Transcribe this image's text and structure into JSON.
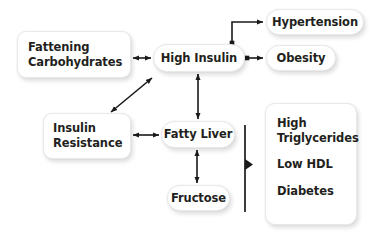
{
  "diagram": {
    "background_color": "#ffffff",
    "text_color": "#231f20",
    "connector_color": "#1a1a1a",
    "nodes": {
      "fattening_carbohydrates": {
        "line1": "Fattening",
        "line2": "Carbohydrates"
      },
      "high_insulin": {
        "label": "High Insulin"
      },
      "hypertension": {
        "label": "Hypertension"
      },
      "obesity": {
        "label": "Obesity"
      },
      "insulin_resistance": {
        "line1": "Insulin",
        "line2": "Resistance"
      },
      "fatty_liver": {
        "label": "Fatty Liver"
      },
      "fructose": {
        "label": "Fructose"
      },
      "outcomes": {
        "item1_line1": "High",
        "item1_line2": "Triglycerides",
        "item2": "Low HDL",
        "item3": "Diabetes"
      }
    },
    "connectors": [
      {
        "name": "fattening-carbohydrates-to-high-insulin",
        "style": "double-arrow",
        "orientation": "horizontal"
      },
      {
        "name": "high-insulin-to-hypertension",
        "style": "elbow-arrow",
        "orientation": "up-right"
      },
      {
        "name": "high-insulin-to-obesity",
        "style": "single-arrow",
        "orientation": "horizontal"
      },
      {
        "name": "high-insulin-to-fatty-liver",
        "style": "double-arrow",
        "orientation": "vertical"
      },
      {
        "name": "insulin-resistance-to-high-insulin",
        "style": "double-arrow",
        "orientation": "diagonal"
      },
      {
        "name": "fatty-liver-to-insulin-resistance",
        "style": "double-arrow",
        "orientation": "horizontal"
      },
      {
        "name": "fructose-to-fatty-liver",
        "style": "double-arrow",
        "orientation": "vertical"
      },
      {
        "name": "outcomes-pointer",
        "style": "vertical-bar-with-triangle",
        "orientation": "right"
      }
    ]
  }
}
